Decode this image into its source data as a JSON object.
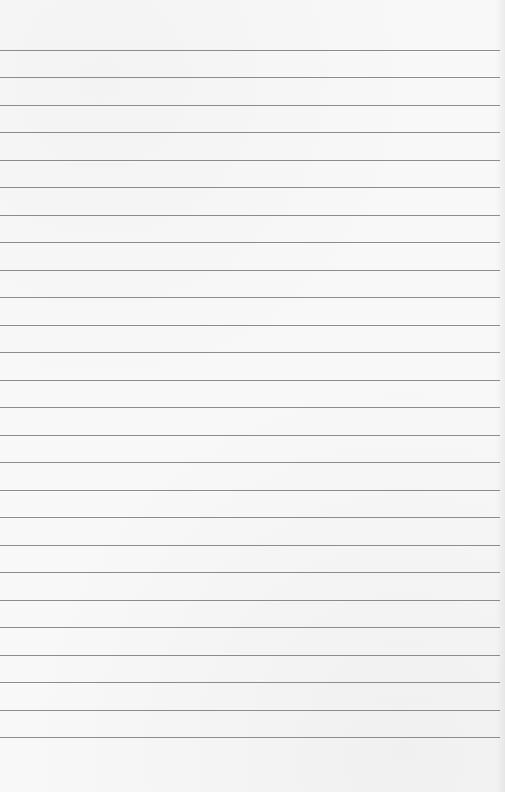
{
  "page": {
    "type": "lined-paper",
    "background_color": "#f8f8f8",
    "rule_color": "#8c8c8c",
    "rule_count": 26,
    "rule_positions_y": [
      50,
      77,
      105,
      132,
      160,
      187,
      215,
      242,
      270,
      297,
      325,
      352,
      380,
      407,
      435,
      462,
      490,
      517,
      545,
      572,
      600,
      627,
      655,
      682,
      710,
      737
    ]
  }
}
